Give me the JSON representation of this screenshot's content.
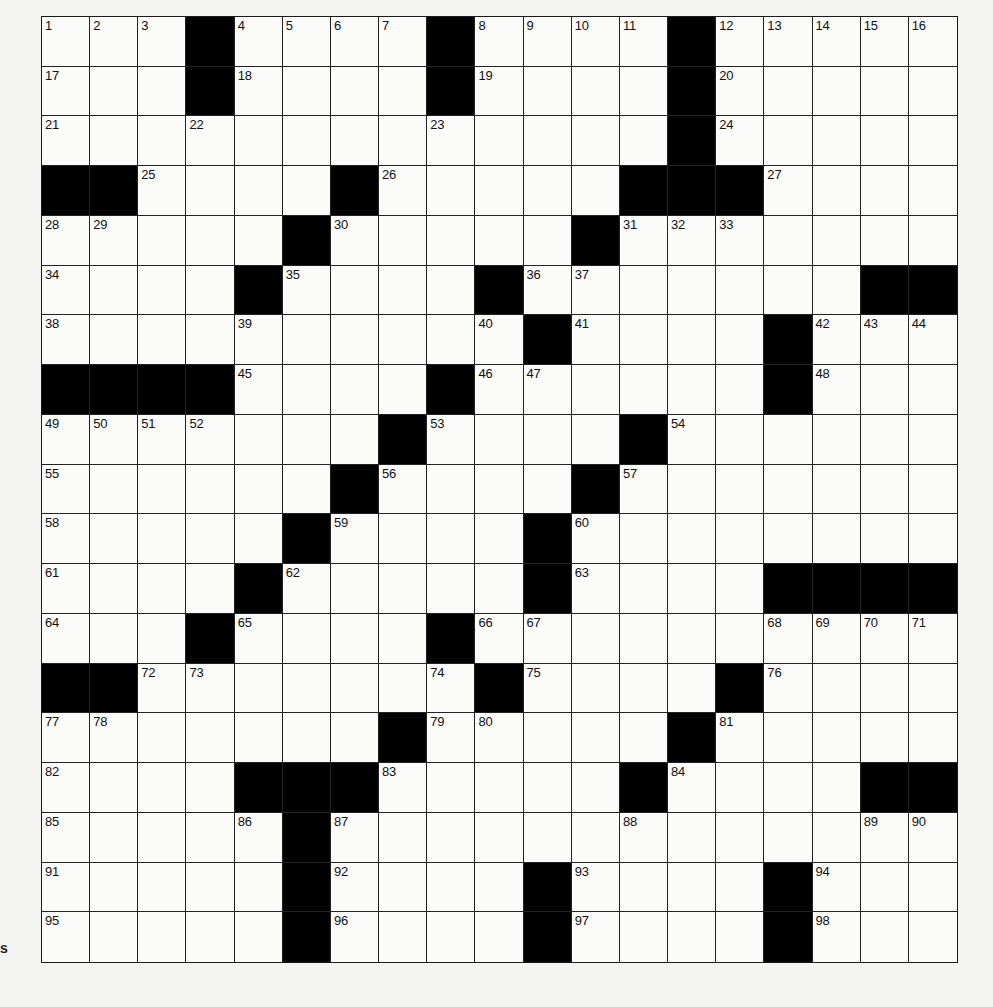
{
  "puzzle": {
    "rows": 19,
    "cols": 19,
    "colors": {
      "block": "#000000",
      "cell": "#fbfbfa",
      "grid_line": "#222222",
      "page": "#f3f3f1"
    },
    "edge_mark": "s",
    "layout": [
      "1 2 3 # 4 5 6 7 # 8 9 10 11 # 12 13 14 15 16",
      "17 . . # 18 . . . # 19 . . . # 20 . . . .",
      "21 . . 22 . . . . 23 . . . . # 24 . . . .",
      "# # 25 . . . # 26 . . . . # # # 27 . . .",
      "28 29 . . . # 30 . . . . # 31 32 33 . . . .",
      "34 . . . # 35 . . . # 36 37 . . . . . # #",
      "38 . . . 39 . . . . 40 # 41 . . . # 42 43 44",
      "# # # # 45 . . . # 46 47 . . . . # 48 . .",
      "49 50 51 52 . . . # 53 . . . # 54 . . . . .",
      "55 . . . . . # 56 . . . # 57 . . . . . .",
      "58 . . . . # 59 . . . # 60 . . . . . . .",
      "61 . . . # 62 . . . . # 63 . . . # # # #",
      "64 . . # 65 . . . # 66 67 . . . . 68 69 70 71",
      "# # 72 73 . . . . 74 # 75 . . . # 76 . . .",
      "77 78 . . . . . # 79 80 . . . # 81 . . . .",
      "82 . . . # # # 83 . . . . # 84 . . . # #",
      "85 . . . 86 # 87 . . . . . 88 . . . . 89 90",
      "91 . . . . # 92 . . . # 93 . . . # 94 . .",
      "95 . . . . # 96 . . . # 97 . . . # 98 . ."
    ],
    "entries": {}
  }
}
